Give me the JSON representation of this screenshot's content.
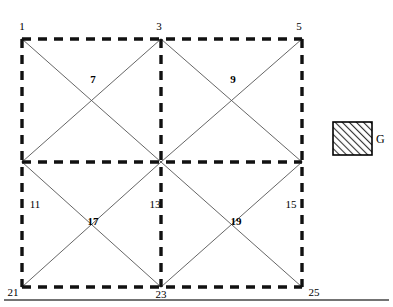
{
  "figure": {
    "width": 393,
    "height": 307
  },
  "style": {
    "line_color": "#000000",
    "dashed_color": "#111111",
    "thin_line_color": "#555555",
    "background": "#ffffff",
    "rule_color": "#444444",
    "hatch_color": "#333333"
  },
  "geometry": {
    "left": 22,
    "mid_x": 161,
    "right": 302,
    "top": 39,
    "mid_y": 162,
    "bottom": 287
  },
  "nodes": [
    {
      "id": "n1",
      "label": "1",
      "x": 22,
      "y": 26,
      "bold": false
    },
    {
      "id": "n3",
      "label": "3",
      "x": 159,
      "y": 26,
      "bold": false
    },
    {
      "id": "n5",
      "label": "5",
      "x": 299,
      "y": 26,
      "bold": false
    },
    {
      "id": "n7",
      "label": "7",
      "x": 93,
      "y": 79,
      "bold": true
    },
    {
      "id": "n9",
      "label": "9",
      "x": 233,
      "y": 79,
      "bold": true
    },
    {
      "id": "n11",
      "label": "11",
      "x": 35,
      "y": 204,
      "bold": false
    },
    {
      "id": "n13",
      "label": "13",
      "x": 155,
      "y": 204,
      "bold": false
    },
    {
      "id": "n15",
      "label": "15",
      "x": 291,
      "y": 204,
      "bold": false
    },
    {
      "id": "n17",
      "label": "17",
      "x": 93,
      "y": 221,
      "bold": true
    },
    {
      "id": "n19",
      "label": "19",
      "x": 236,
      "y": 221,
      "bold": true
    },
    {
      "id": "n21",
      "label": "21",
      "x": 13,
      "y": 292,
      "bold": false
    },
    {
      "id": "n23",
      "label": "23",
      "x": 161,
      "y": 294,
      "bold": false
    },
    {
      "id": "n25",
      "label": "25",
      "x": 314,
      "y": 292,
      "bold": false
    }
  ],
  "legend": {
    "swatch": {
      "x": 333,
      "y": 122,
      "width": 39,
      "height": 33
    },
    "label": "G",
    "label_x": 376,
    "label_y": 139,
    "pattern": "diagonal-hatch"
  },
  "bottom_rule": {
    "x1": 4,
    "x2": 389,
    "y": 300
  },
  "dashed_segments": [
    {
      "name": "outer-top",
      "x1": 22,
      "y1": 39,
      "x2": 302,
      "y2": 39
    },
    {
      "name": "outer-bottom",
      "x1": 22,
      "y1": 287,
      "x2": 302,
      "y2": 287
    },
    {
      "name": "outer-left",
      "x1": 22,
      "y1": 39,
      "x2": 22,
      "y2": 287
    },
    {
      "name": "outer-right",
      "x1": 302,
      "y1": 39,
      "x2": 302,
      "y2": 287
    },
    {
      "name": "middle-horizontal",
      "x1": 22,
      "y1": 162,
      "x2": 302,
      "y2": 162
    },
    {
      "name": "middle-vertical",
      "x1": 161,
      "y1": 39,
      "x2": 161,
      "y2": 287
    }
  ],
  "diagonal_segments": [
    {
      "name": "cell-tl-diag-down",
      "x1": 22,
      "y1": 39,
      "x2": 161,
      "y2": 162
    },
    {
      "name": "cell-tl-diag-up",
      "x1": 22,
      "y1": 162,
      "x2": 161,
      "y2": 39
    },
    {
      "name": "cell-tr-diag-down",
      "x1": 161,
      "y1": 39,
      "x2": 302,
      "y2": 162
    },
    {
      "name": "cell-tr-diag-up",
      "x1": 161,
      "y1": 162,
      "x2": 302,
      "y2": 39
    },
    {
      "name": "cell-bl-diag-down",
      "x1": 22,
      "y1": 162,
      "x2": 161,
      "y2": 287
    },
    {
      "name": "cell-bl-diag-up",
      "x1": 22,
      "y1": 287,
      "x2": 161,
      "y2": 162
    },
    {
      "name": "cell-br-diag-down",
      "x1": 161,
      "y1": 162,
      "x2": 302,
      "y2": 287
    },
    {
      "name": "cell-br-diag-up",
      "x1": 161,
      "y1": 287,
      "x2": 302,
      "y2": 162
    }
  ]
}
